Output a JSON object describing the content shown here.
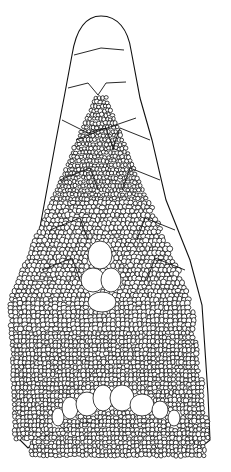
{
  "figure": {
    "colors": {
      "line": "#111111",
      "background": "#ffffff"
    },
    "large_scales": {
      "snout_tip": [
        [
          72,
          55
        ],
        [
          80,
          28
        ],
        [
          101,
          16
        ],
        [
          122,
          26
        ],
        [
          130,
          50
        ]
      ],
      "rows": [
        [
          [
            74,
            55
          ],
          [
            101,
            48
          ],
          [
            124,
            50
          ]
        ],
        [
          [
            68,
            88
          ],
          [
            88,
            83
          ],
          [
            98,
            95
          ],
          [
            106,
            83
          ],
          [
            126,
            82
          ]
        ],
        [
          [
            62,
            120
          ],
          [
            88,
            133
          ],
          [
            98,
            130
          ],
          [
            107,
            128
          ],
          [
            136,
            118
          ]
        ]
      ],
      "side_left": [
        [
          72,
          55
        ],
        [
          64,
          100
        ],
        [
          55,
          140
        ],
        [
          44,
          200
        ],
        [
          32,
          260
        ],
        [
          28,
          300
        ]
      ],
      "side_right": [
        [
          130,
          50
        ],
        [
          140,
          98
        ],
        [
          152,
          140
        ],
        [
          165,
          200
        ],
        [
          190,
          260
        ],
        [
          200,
          300
        ]
      ]
    },
    "granular_field": {
      "triangle": [
        [
          98,
          95
        ],
        [
          106,
          95
        ],
        [
          190,
          300
        ],
        [
          205,
          470
        ],
        [
          20,
          470
        ],
        [
          30,
          300
        ]
      ],
      "large_center_cells": [
        {
          "cx": 100,
          "cy": 255,
          "rx": 12,
          "ry": 14
        },
        {
          "cx": 93,
          "cy": 280,
          "rx": 12,
          "ry": 12
        },
        {
          "cx": 111,
          "cy": 280,
          "rx": 10,
          "ry": 12
        },
        {
          "cx": 102,
          "cy": 302,
          "rx": 14,
          "ry": 10
        }
      ],
      "lower_arc_cells": [
        {
          "cx": 58,
          "cy": 417,
          "rx": 6,
          "ry": 9
        },
        {
          "cx": 70,
          "cy": 408,
          "rx": 8,
          "ry": 11
        },
        {
          "cx": 87,
          "cy": 404,
          "rx": 11,
          "ry": 12
        },
        {
          "cx": 103,
          "cy": 398,
          "rx": 10,
          "ry": 13
        },
        {
          "cx": 122,
          "cy": 398,
          "rx": 12,
          "ry": 13
        },
        {
          "cx": 142,
          "cy": 405,
          "rx": 12,
          "ry": 11
        },
        {
          "cx": 160,
          "cy": 410,
          "rx": 8,
          "ry": 9
        },
        {
          "cx": 174,
          "cy": 418,
          "rx": 6,
          "ry": 8
        }
      ]
    }
  }
}
